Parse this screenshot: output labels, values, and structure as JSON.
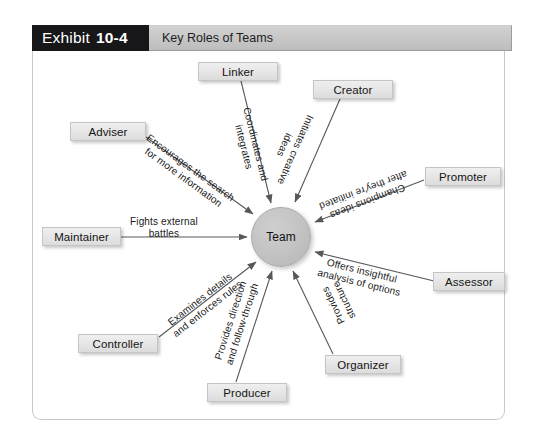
{
  "exhibit": {
    "label": "Exhibit",
    "number": "10-4",
    "title": "Key Roles of Teams"
  },
  "center": {
    "label": "Team"
  },
  "colors": {
    "header_block": "#17171a",
    "header_bar": "#c6c6c6",
    "box_fill": "#e6e6e6",
    "box_border": "#c5c5c5",
    "center_fill": "#c2c2c2",
    "frame_border": "#c9c9c9",
    "line": "#58585a"
  },
  "roles": [
    {
      "id": "linker",
      "name": "Linker",
      "description": "Coordinates and\nintegrates",
      "direction": "to-team"
    },
    {
      "id": "creator",
      "name": "Creator",
      "description": "Initiates creative\nideas",
      "direction": "to-team"
    },
    {
      "id": "adviser",
      "name": "Adviser",
      "description": "Encourages the search\nfor more information",
      "direction": "to-team"
    },
    {
      "id": "promoter",
      "name": "Promoter",
      "description": "Champions ideas\nafter they're initiated",
      "direction": "to-team"
    },
    {
      "id": "maintainer",
      "name": "Maintainer",
      "description": "Fights external\nbattles",
      "direction": "to-team"
    },
    {
      "id": "assessor",
      "name": "Assessor",
      "description": "Offers insightful\nanalysis of options",
      "direction": "to-team"
    },
    {
      "id": "controller",
      "name": "Controller",
      "description": "Examines details\nand enforces rules",
      "direction": "to-team"
    },
    {
      "id": "producer",
      "name": "Producer",
      "description": "Provides direction\nand follow-through",
      "direction": "to-team"
    },
    {
      "id": "organizer",
      "name": "Organizer",
      "description": "Provides\nstructure",
      "direction": "to-team"
    }
  ]
}
